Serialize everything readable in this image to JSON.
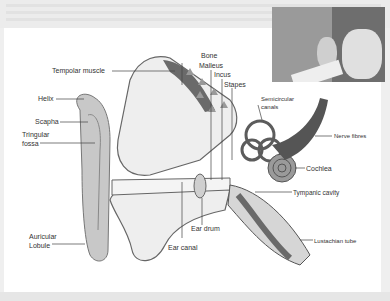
{
  "diagram": {
    "labels": {
      "bone": "Bone",
      "malleus": "Malleus",
      "incus": "Incus",
      "stapes": "Stapes",
      "temporal_muscle": "Tempolar muscle",
      "semicircular_canals_1": "Semicircular",
      "semicircular_canals_2": "canals",
      "helix": "Helix",
      "scapha": "Scapha",
      "triangular_fossa_1": "Tringular",
      "triangular_fossa_2": "fossa",
      "nerve_fibres": "Nerve fibres",
      "cochlea": "Cochlea",
      "tympanic_cavity": "Tympanic  cavity",
      "ear_drum": "Ear drum",
      "auricular_lobule_1": "Auricular",
      "auricular_lobule_2": "Lobule",
      "ear_canal": "Ear canal",
      "eustachian_tube": "Lustachian tube"
    },
    "photo": {
      "description": "Girl cupping hand behind ear to listen"
    },
    "colors": {
      "background": "#ffffff",
      "frame": "#efefef",
      "ink": "#333333",
      "dark_tissue": "#6a6a6a",
      "mid_tissue": "#b5b5b5",
      "light_tissue": "#e6e6e6"
    }
  }
}
